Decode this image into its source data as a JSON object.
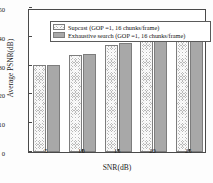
{
  "chart_data": {
    "type": "bar",
    "title": "",
    "xlabel": "SNR(dB)",
    "ylabel": "Average PSNR(dB)",
    "categories": [
      "5",
      "10",
      "15",
      "20",
      "25"
    ],
    "series": [
      {
        "name": "Supcast  (GOP =1, 16 chunks/frame)",
        "pattern": "hatched",
        "color": "#b9b9b9",
        "values": [
          30.1,
          33.8,
          37.0,
          39.9,
          41.8
        ]
      },
      {
        "name": "Exhaustive search  (GOP =1, 16 chunks/frame)",
        "pattern": "solid",
        "color": "#a8a8a8",
        "values": [
          30.2,
          34.1,
          37.7,
          40.4,
          42.5
        ]
      }
    ],
    "ylim": [
      0,
      50
    ],
    "yticks": [
      0,
      10,
      20,
      30,
      40,
      50
    ],
    "ytick_labels": [
      "0",
      "10",
      "20",
      "30",
      "40",
      "50"
    ],
    "xtick_labels": [
      "5",
      "10",
      "15",
      "20",
      "25"
    ],
    "grid": false,
    "legend_position": "upper left"
  },
  "legend": {
    "entries": [
      {
        "label": "Supcast  (GOP =1, 16 chunks/frame)"
      },
      {
        "label": "Exhaustive search  (GOP =1, 16 chunks/frame)"
      }
    ]
  }
}
